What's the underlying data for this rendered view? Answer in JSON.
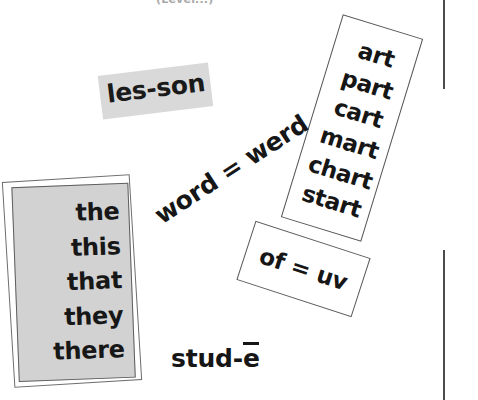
{
  "page": {
    "width": 478,
    "height": 400,
    "background": "#ffffff",
    "header_snippet": "(Level...)"
  },
  "colors": {
    "ink": "#161616",
    "highlight_gray": "#d9d9d9",
    "panel_gray": "#d2d2d2",
    "border": "#555555",
    "rule": "#4c4c4c",
    "faint_text": "#a9a9a9"
  },
  "cards": {
    "lesson_chip": {
      "label": "les-son",
      "style": "gray-highlight",
      "rotation_deg": -7
    },
    "sight_word_list": {
      "style": "gray-panel-double-border",
      "rotation_deg": -2.2,
      "words": [
        "the",
        "this",
        "that",
        "they",
        "there"
      ]
    },
    "art_word_family_list": {
      "style": "white-outline",
      "rotation_deg": 17,
      "words": [
        "art",
        "part",
        "cart",
        "mart",
        "chart",
        "start"
      ]
    },
    "of_equals_uv": {
      "label": "of = uv",
      "style": "white-outline",
      "rotation_deg": 18
    }
  },
  "loose_phrases": {
    "word_equals_werd": {
      "label": "word = werd",
      "rotation_deg": -33
    },
    "stud_long_e": {
      "prefix": "stud-",
      "vowel": "e",
      "full": "stud-ē"
    }
  },
  "rules": {
    "top_rule_label": "margin-rule-top",
    "bottom_rule_label": "margin-rule-bottom"
  }
}
